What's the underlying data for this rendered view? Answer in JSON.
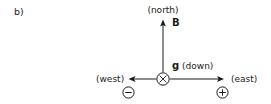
{
  "figure": {
    "panel_label": "b)",
    "background_color": "#ffffff",
    "stroke_color": "#1a1a1a"
  },
  "labels": {
    "north": "(north)",
    "west": "(west)",
    "east": "(east)",
    "down": "(down)"
  },
  "vectors": {
    "magnetic_field_symbol": "B",
    "gravity_symbol": "g"
  },
  "symbols": {
    "center_icon": "circle-x-into-page",
    "negative_icon": "circle-minus",
    "positive_icon": "circle-plus"
  }
}
